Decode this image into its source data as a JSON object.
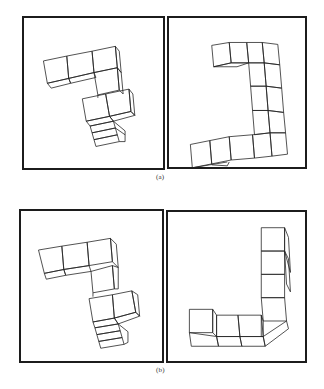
{
  "figure": {
    "rows": [
      {
        "label": "(a)",
        "panels": [
          {
            "id": "a-left",
            "description": "3D cube-arrangement object, orientation 1"
          },
          {
            "id": "a-right",
            "description": "3D cube-arrangement object, orientation 2"
          }
        ]
      },
      {
        "label": "(b)",
        "panels": [
          {
            "id": "b-left",
            "description": "3D cube-arrangement object, orientation 1"
          },
          {
            "id": "b-right",
            "description": "3D cube-arrangement object, orientation 2"
          }
        ]
      }
    ]
  },
  "colors": {
    "line": "#222222",
    "frame": "#1c1c1c",
    "background": "#ffffff"
  }
}
